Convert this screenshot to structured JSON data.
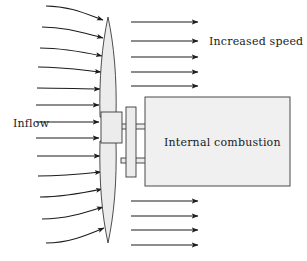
{
  "figure": {
    "type": "diagram",
    "background_color": "#ffffff",
    "line_color": "#1c1c1c",
    "part_fill_color": "#ececec",
    "part_stroke_color": "#3a3a3a",
    "width": 307,
    "height": 261
  },
  "labels": {
    "inflow": "Inflow",
    "increased_speed": "Increased speed",
    "engine": "Internal combustion"
  },
  "label_positions": {
    "inflow": {
      "x": 13,
      "y": 127
    },
    "increased_speed": {
      "x": 209,
      "y": 45
    },
    "engine": {
      "x": 164,
      "y": 146
    }
  },
  "components": {
    "propeller": {
      "name": "two-bladed propeller",
      "upper_blade": {
        "tip_y": 17,
        "root_y": 117,
        "center_x": 108,
        "max_half_width": 9
      },
      "lower_blade": {
        "tip_y": 243,
        "root_y": 141,
        "center_x": 108,
        "max_half_width": 9
      },
      "fill": "#ececec"
    },
    "hub": {
      "name": "propeller hub",
      "x": 101,
      "y": 112,
      "width": 21,
      "height": 31,
      "fill": "#ececec"
    },
    "shaft": {
      "name": "drive shaft",
      "upper_y": 124,
      "lower_y": 159,
      "x_start": 122,
      "x_end": 148,
      "fill": "#ececec"
    },
    "flange_plate": {
      "name": "flange plate",
      "x": 126,
      "y": 107,
      "width": 10,
      "height": 70,
      "fill": "#ececec"
    },
    "engine_box": {
      "name": "internal combustion engine housing",
      "x": 145,
      "y": 97,
      "width": 145,
      "height": 89,
      "fill": "#f0f0f0"
    }
  },
  "flow": {
    "inflow_arrow_count": 13,
    "inflow_description": "streamlines entering from the left, curving inward toward the propeller disc at the top and bottom, straight near the hub",
    "outflow_upper_count": 5,
    "outflow_lower_count": 4,
    "outflow_description": "straight horizontal arrows of increased speed leaving the propeller disc above and below the engine housing",
    "inflow_arrows": [
      {
        "index": 1,
        "x_start": 46,
        "y_start": 6,
        "x_end": 104,
        "y_end": 20,
        "curvature": "strong-down"
      },
      {
        "index": 2,
        "x_start": 42,
        "y_start": 27,
        "x_end": 104,
        "y_end": 38,
        "curvature": "strong-down"
      },
      {
        "index": 3,
        "x_start": 40,
        "y_start": 48,
        "x_end": 103,
        "y_end": 56,
        "curvature": "medium-down"
      },
      {
        "index": 4,
        "x_start": 38,
        "y_start": 67,
        "x_end": 102,
        "y_end": 72,
        "curvature": "medium-down"
      },
      {
        "index": 5,
        "x_start": 37,
        "y_start": 88,
        "x_end": 101,
        "y_end": 89,
        "curvature": "slight-down"
      },
      {
        "index": 6,
        "x_start": 36,
        "y_start": 105,
        "x_end": 100,
        "y_end": 105,
        "curvature": "straight"
      },
      {
        "index": 7,
        "x_start": 36,
        "y_start": 122,
        "x_end": 100,
        "y_end": 122,
        "curvature": "straight"
      },
      {
        "index": 8,
        "x_start": 36,
        "y_start": 138,
        "x_end": 100,
        "y_end": 138,
        "curvature": "straight"
      },
      {
        "index": 9,
        "x_start": 37,
        "y_start": 156,
        "x_end": 101,
        "y_end": 156,
        "curvature": "straight"
      },
      {
        "index": 10,
        "x_start": 38,
        "y_start": 176,
        "x_end": 102,
        "y_end": 172,
        "curvature": "slight-up"
      },
      {
        "index": 11,
        "x_start": 40,
        "y_start": 197,
        "x_end": 103,
        "y_end": 189,
        "curvature": "medium-up"
      },
      {
        "index": 12,
        "x_start": 42,
        "y_start": 219,
        "x_end": 104,
        "y_end": 207,
        "curvature": "strong-up"
      },
      {
        "index": 13,
        "x_start": 46,
        "y_start": 243,
        "x_end": 105,
        "y_end": 228,
        "curvature": "strong-up"
      }
    ],
    "outflow_arrows_upper": [
      {
        "index": 1,
        "x_start": 131,
        "x_end": 199,
        "y": 22
      },
      {
        "index": 2,
        "x_start": 131,
        "x_end": 199,
        "y": 41
      },
      {
        "index": 3,
        "x_start": 131,
        "x_end": 199,
        "y": 57
      },
      {
        "index": 4,
        "x_start": 131,
        "x_end": 199,
        "y": 72
      },
      {
        "index": 5,
        "x_start": 131,
        "x_end": 199,
        "y": 86
      }
    ],
    "outflow_arrows_lower": [
      {
        "index": 1,
        "x_start": 131,
        "x_end": 199,
        "y": 201
      },
      {
        "index": 2,
        "x_start": 131,
        "x_end": 199,
        "y": 216
      },
      {
        "index": 3,
        "x_start": 131,
        "x_end": 199,
        "y": 230
      },
      {
        "index": 4,
        "x_start": 131,
        "x_end": 199,
        "y": 245
      }
    ]
  }
}
